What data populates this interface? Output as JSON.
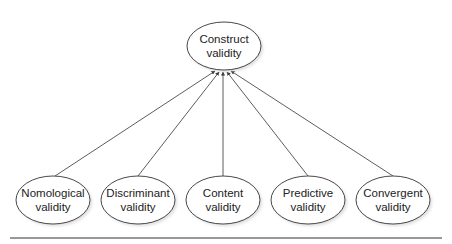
{
  "diagram": {
    "type": "hierarchy",
    "root": {
      "id": "construct",
      "line1": "Construct",
      "line2": "validity",
      "cx": 224,
      "cy": 46,
      "rx": 37,
      "ry": 24
    },
    "children": [
      {
        "id": "nomological",
        "line1": "Nomological",
        "line2": "validity",
        "cx": 53,
        "cy": 200,
        "rx": 37,
        "ry": 24
      },
      {
        "id": "discriminant",
        "line1": "Discriminant",
        "line2": "validity",
        "cx": 138,
        "cy": 200,
        "rx": 37,
        "ry": 24
      },
      {
        "id": "content",
        "line1": "Content",
        "line2": "validity",
        "cx": 223,
        "cy": 200,
        "rx": 37,
        "ry": 24
      },
      {
        "id": "predictive",
        "line1": "Predictive",
        "line2": "validity",
        "cx": 308,
        "cy": 200,
        "rx": 37,
        "ry": 24
      },
      {
        "id": "convergent",
        "line1": "Convergent",
        "line2": "validity",
        "cx": 393,
        "cy": 200,
        "rx": 37,
        "ry": 24
      }
    ],
    "edges": [
      {
        "from": "nomological",
        "to": "construct",
        "x1": 55,
        "y1": 176,
        "x2": 215,
        "y2": 71
      },
      {
        "from": "discriminant",
        "to": "construct",
        "x1": 138,
        "y1": 176,
        "x2": 219,
        "y2": 72
      },
      {
        "from": "content",
        "to": "construct",
        "x1": 223,
        "y1": 176,
        "x2": 223,
        "y2": 72
      },
      {
        "from": "predictive",
        "to": "construct",
        "x1": 308,
        "y1": 176,
        "x2": 227,
        "y2": 72
      },
      {
        "from": "convergent",
        "to": "construct",
        "x1": 393,
        "y1": 176,
        "x2": 231,
        "y2": 71
      }
    ],
    "colors": {
      "stroke": "#333333",
      "fill": "#ffffff",
      "shadow": "#cfcfcf",
      "text": "#222222"
    }
  }
}
